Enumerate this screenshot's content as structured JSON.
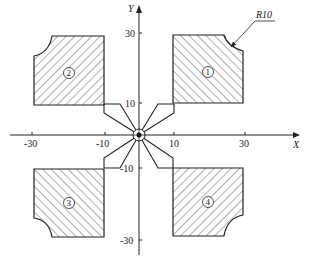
{
  "axes": {
    "x_label": "X",
    "y_label": "Y",
    "x_ticks": [
      "-30",
      "-10",
      "10",
      "30"
    ],
    "y_ticks": [
      "30",
      "10",
      "-10",
      "-30"
    ]
  },
  "parts": [
    {
      "id": "1",
      "label": "1",
      "quadrant": "upper-right"
    },
    {
      "id": "2",
      "label": "2",
      "quadrant": "upper-left"
    },
    {
      "id": "3",
      "label": "3",
      "quadrant": "lower-left"
    },
    {
      "id": "4",
      "label": "4",
      "quadrant": "lower-right"
    }
  ],
  "annotation": {
    "radius_label": "R10"
  },
  "colors": {
    "line": "#222222",
    "hatch": "#333333",
    "background": "#ffffff"
  }
}
